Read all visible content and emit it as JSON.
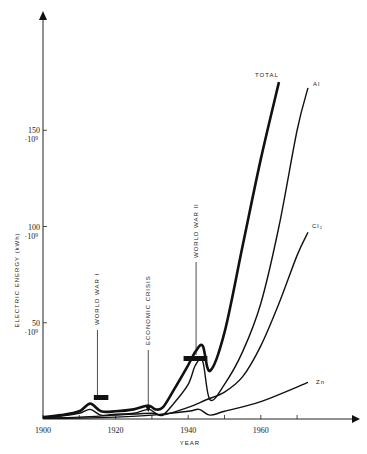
{
  "chart_data": {
    "type": "line",
    "title": "",
    "xlabel": "YEAR",
    "ylabel": "ELECTRIC ENERGY (kWh)",
    "xlim": [
      1900,
      1980
    ],
    "ylim": [
      0,
      190
    ],
    "x_ticks": [
      1900,
      1910,
      1920,
      1930,
      1940,
      1950,
      1960,
      1970
    ],
    "x_tick_labels": [
      "1900",
      "",
      "1920",
      "",
      "1940",
      "",
      "1960",
      ""
    ],
    "y_ticks": [
      50,
      100,
      150
    ],
    "y_tick_labels": [
      {
        "value": "50",
        "exp": "·10⁹"
      },
      {
        "value": "100",
        "exp": "·10⁹"
      },
      {
        "value": "150",
        "exp": "·10⁹"
      }
    ],
    "grid": false,
    "series": [
      {
        "name": "TOTAL",
        "label": "TOTAL",
        "bold": true,
        "x": [
          1900,
          1905,
          1910,
          1913,
          1916,
          1920,
          1925,
          1929,
          1931,
          1933,
          1936,
          1940,
          1942,
          1944,
          1946,
          1950,
          1955,
          1960,
          1965
        ],
        "y": [
          1,
          2,
          4,
          8,
          4,
          4,
          5,
          7,
          5,
          6,
          15,
          28,
          35,
          38,
          25,
          45,
          90,
          135,
          175
        ]
      },
      {
        "name": "Al",
        "label": "Al",
        "bold": false,
        "x": [
          1900,
          1905,
          1910,
          1913,
          1916,
          1920,
          1925,
          1929,
          1931,
          1933,
          1936,
          1940,
          1942,
          1944,
          1946,
          1950,
          1955,
          1960,
          1965,
          1970,
          1973
        ],
        "y": [
          0.5,
          1.5,
          3,
          5,
          2,
          2.5,
          3,
          5,
          3,
          2,
          8,
          18,
          28,
          30,
          10,
          18,
          35,
          60,
          100,
          150,
          172
        ]
      },
      {
        "name": "Cl2",
        "label": "Cl₂",
        "bold": false,
        "x": [
          1900,
          1910,
          1920,
          1930,
          1933,
          1940,
          1945,
          1950,
          1955,
          1960,
          1965,
          1970,
          1973
        ],
        "y": [
          0.5,
          1,
          2,
          3,
          2,
          6,
          10,
          14,
          22,
          38,
          60,
          85,
          97
        ]
      },
      {
        "name": "Zn",
        "label": "Zn",
        "bold": false,
        "x": [
          1900,
          1910,
          1920,
          1930,
          1940,
          1943,
          1946,
          1950,
          1960,
          1973
        ],
        "y": [
          0.3,
          0.5,
          1,
          2,
          4,
          5,
          2,
          4,
          9,
          19
        ]
      }
    ],
    "annotations": [
      {
        "text": "WORLD WAR I",
        "x": 1915,
        "span": [
          1914,
          1918
        ]
      },
      {
        "text": "ECONOMIC CRISIS",
        "x": 1929
      },
      {
        "text": "WORLD WAR II",
        "x": 1943,
        "span": [
          1939,
          1945
        ]
      }
    ]
  }
}
